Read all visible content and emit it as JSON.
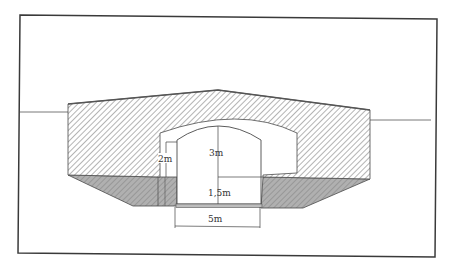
{
  "diagram": {
    "type": "cross-section",
    "labels": {
      "inner_height": "3m",
      "headroom": "2m",
      "lower_height": "1,5m",
      "width": "5m"
    },
    "colors": {
      "frame": "#3a3a3a",
      "outline": "#4a4a4a",
      "hatch": "#9a9a9a",
      "foundation_fill": "#a9a9a9",
      "background": "#ffffff"
    }
  }
}
